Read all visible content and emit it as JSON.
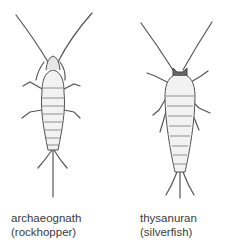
{
  "figures": [
    {
      "name": "archaeognath",
      "caption_line1": "archaeognath",
      "caption_line2": "(rockhopper)"
    },
    {
      "name": "thysanuran",
      "caption_line1": "thysanuran",
      "caption_line2": "(silverfish)"
    }
  ],
  "colors": {
    "ink": "#555555",
    "body_fill": "#f2f2f2",
    "text": "#3a3a3a"
  }
}
